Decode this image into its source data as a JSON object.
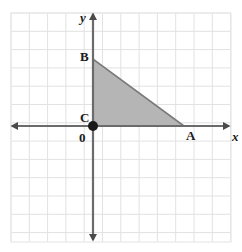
{
  "figure": {
    "background_color": "#ffffff",
    "grid": {
      "line_color": "#e2e2e2",
      "border_color": "#e8e8e8",
      "cell_size": 18.3,
      "left": 11,
      "top": 13,
      "right": 231,
      "bottom": 242,
      "columns": 12,
      "rows": 12.5,
      "visible": true
    },
    "axes": {
      "color": "#6b6b6b",
      "origin": {
        "x": 93,
        "y": 126
      },
      "x_axis": {
        "from_x": 12,
        "to_x": 229,
        "y": 126,
        "arrow_left": true,
        "arrow_right": true
      },
      "y_axis": {
        "x": 93,
        "from_y": 14,
        "to_y": 240,
        "arrow_up": true,
        "arrow_down": true
      },
      "x_label": "x",
      "y_label": "y",
      "origin_label": "0"
    },
    "shape": {
      "type": "triangle",
      "fill_color": "#b5b5b5",
      "stroke_color": "#7a7a7a",
      "stroke_width": 1.6,
      "vertices": [
        {
          "name": "C",
          "x": 93,
          "y": 126,
          "label": "C",
          "label_x": 80,
          "label_y": 111
        },
        {
          "name": "B",
          "x": 93,
          "y": 59,
          "label": "B",
          "label_x": 80,
          "label_y": 50
        },
        {
          "name": "A",
          "x": 184,
          "y": 126,
          "label": "A",
          "label_x": 186,
          "label_y": 129
        }
      ]
    },
    "origin_dot": {
      "x": 93,
      "y": 126,
      "radius": 5,
      "color": "#1a1a1a"
    }
  }
}
